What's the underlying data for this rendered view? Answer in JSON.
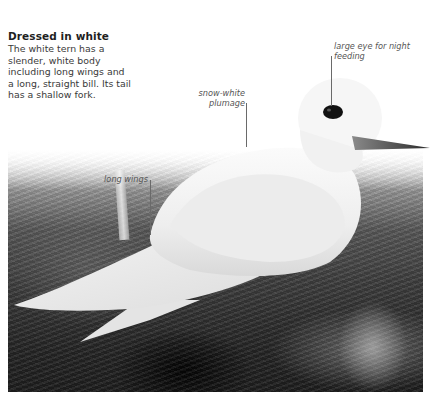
{
  "heading": "Dressed in white",
  "description": "The white tern has a slender, white body including long wings and a long, straight bill. Its tail has a shallow fork.",
  "callouts": {
    "eye": "large eye for night feeding",
    "plumage": "snow-white plumage",
    "wings": "long wings"
  },
  "photo": {
    "subject": "white tern perched on tree bark",
    "icon": "bird-photo"
  },
  "colors": {
    "heading": "#1f1f1f",
    "body_text": "#3a3a3a",
    "callout_text": "#555555",
    "leader_line": "#6a6a6a",
    "background": "#ffffff"
  }
}
